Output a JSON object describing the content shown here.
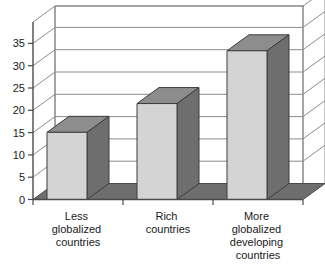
{
  "chart_data": {
    "type": "bar",
    "style": "3d-column",
    "title": "",
    "subtitle": "",
    "xlabel": "",
    "ylabel": "",
    "categories": [
      "Less globalized countries",
      "Rich countries",
      "More globalized developing countries"
    ],
    "category_lines": [
      [
        "Less",
        "globalized",
        "countries"
      ],
      [
        "Rich",
        "countries"
      ],
      [
        "More",
        "globalized",
        "developing",
        "countries"
      ]
    ],
    "values": [
      14,
      20,
      31
    ],
    "series": [
      {
        "name": "",
        "values": [
          14,
          20,
          31
        ]
      }
    ],
    "ylim": [
      0,
      37
    ],
    "ytick_values": [
      0,
      5,
      10,
      15,
      20,
      25,
      30,
      35
    ],
    "ytick_labels": [
      "0",
      "5",
      "10",
      "15",
      "20",
      "25",
      "30",
      "35"
    ],
    "grid": true,
    "grid_axis": "y",
    "legend": false,
    "legend_position": "none",
    "annotations": []
  },
  "colors": {
    "bar_front": "#d4d4d4",
    "bar_side": "#6e6e6e",
    "bar_top": "#8d8d8d",
    "floor": "#6e6e6e",
    "wall": "#ffffff",
    "grid_line": "#8c8c8c",
    "axis_line": "#4a4a4a",
    "text": "#1a1a1a",
    "background": "#ffffff"
  }
}
